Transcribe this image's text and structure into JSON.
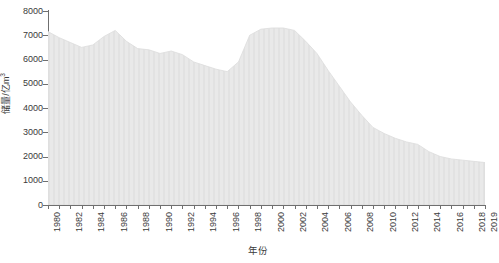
{
  "chart": {
    "type": "area",
    "background": "#ffffff",
    "fill_color": "#e9e9e9",
    "edge_color": "#dcdcdc",
    "axis_color": "#6f6f6f",
    "text_color": "#3a3a3a"
  },
  "axes": {
    "y_title": "储量/亿m",
    "y_title_sup": "3",
    "x_title": "年份",
    "y_ticks": [
      0,
      1000,
      2000,
      3000,
      4000,
      5000,
      6000,
      7000,
      8000
    ],
    "y_tick_labels": [
      "0",
      "1000",
      "2000",
      "3000",
      "4000",
      "5000",
      "6000",
      "7000",
      "8000"
    ],
    "ylim": [
      0,
      8000
    ],
    "xlim": [
      1980,
      2019
    ],
    "x_tick_labels": [
      "1980",
      "1982",
      "1984",
      "1986",
      "1988",
      "1990",
      "1992",
      "1994",
      "1996",
      "1998",
      "2000",
      "2002",
      "2004",
      "2006",
      "2008",
      "2010",
      "2012",
      "2014",
      "2016",
      "2018",
      "2019"
    ],
    "grid": false,
    "legend": "none"
  },
  "chart_data": {
    "type": "area",
    "title": "",
    "xlabel": "年份",
    "ylabel": "储量/亿m³",
    "xlim": [
      1980,
      2019
    ],
    "ylim": [
      0,
      8000
    ],
    "grid": false,
    "legend_position": "none",
    "x": [
      1980,
      1981,
      1982,
      1983,
      1984,
      1985,
      1986,
      1987,
      1988,
      1989,
      1990,
      1991,
      1992,
      1993,
      1994,
      1995,
      1996,
      1997,
      1998,
      1999,
      2000,
      2001,
      2002,
      2003,
      2004,
      2005,
      2006,
      2007,
      2008,
      2009,
      2010,
      2011,
      2012,
      2013,
      2014,
      2015,
      2016,
      2017,
      2018,
      2019
    ],
    "categories": [
      "1980",
      "1981",
      "1982",
      "1983",
      "1984",
      "1985",
      "1986",
      "1987",
      "1988",
      "1989",
      "1990",
      "1991",
      "1992",
      "1993",
      "1994",
      "1995",
      "1996",
      "1997",
      "1998",
      "1999",
      "2000",
      "2001",
      "2002",
      "2003",
      "2004",
      "2005",
      "2006",
      "2007",
      "2008",
      "2009",
      "2010",
      "2011",
      "2012",
      "2013",
      "2014",
      "2015",
      "2016",
      "2017",
      "2018",
      "2019"
    ],
    "values": [
      7150,
      6900,
      6700,
      6500,
      6600,
      6950,
      7200,
      6750,
      6450,
      6400,
      6250,
      6350,
      6200,
      5900,
      5750,
      5600,
      5500,
      5900,
      7000,
      7250,
      7300,
      7300,
      7200,
      6750,
      6250,
      5550,
      4900,
      4250,
      3700,
      3200,
      2950,
      2750,
      2600,
      2500,
      2200,
      2000,
      1900,
      1850,
      1800,
      1750
    ],
    "series": [
      {
        "name": "储量",
        "values": [
          7150,
          6900,
          6700,
          6500,
          6600,
          6950,
          7200,
          6750,
          6450,
          6400,
          6250,
          6350,
          6200,
          5900,
          5750,
          5600,
          5500,
          5900,
          7000,
          7250,
          7300,
          7300,
          7200,
          6750,
          6250,
          5550,
          4900,
          4250,
          3700,
          3200,
          2950,
          2750,
          2600,
          2500,
          2200,
          2000,
          1900,
          1850,
          1800,
          1750
        ]
      }
    ]
  }
}
